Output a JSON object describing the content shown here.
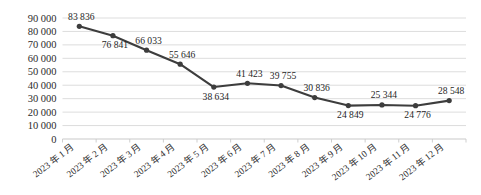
{
  "chart_data": {
    "type": "line",
    "title": "",
    "subtitle": "",
    "xlabel": "",
    "ylabel": "",
    "categories": [
      "2023 年 1 月",
      "2023 年 2 月",
      "2023 年 3 月",
      "2023 年 4 月",
      "2023 年 5 月",
      "2023 年 6 月",
      "2023 年 7 月",
      "2023 年 8 月",
      "2023 年 9 月",
      "2023 年 10 月",
      "2023 年 11 月",
      "2023 年 12 月"
    ],
    "values": [
      83836,
      76841,
      66033,
      55646,
      38634,
      41423,
      39755,
      30836,
      24849,
      25344,
      24776,
      28548
    ],
    "point_labels": [
      "83 836",
      "76 841",
      "66 033",
      "55 646",
      "38 634",
      "41 423",
      "39 755",
      "30 836",
      "24 849",
      "25 344",
      "24 776",
      "28 548"
    ],
    "label_positions": [
      "above",
      "below",
      "above",
      "above",
      "below",
      "above",
      "above",
      "above",
      "below",
      "above",
      "below",
      "above"
    ],
    "ylim": [
      0,
      90000
    ],
    "ytick_values": [
      0,
      10000,
      20000,
      30000,
      40000,
      50000,
      60000,
      70000,
      80000,
      90000
    ],
    "ytick_labels": [
      "0",
      "10 000",
      "20 000",
      "30 000",
      "40 000",
      "50 000",
      "60 000",
      "70 000",
      "80 000",
      "90 000"
    ],
    "grid": true,
    "grid_axis": "y",
    "legend": false,
    "legend_position": "none",
    "series": [
      {
        "name": "",
        "values": [
          83836,
          76841,
          66033,
          55646,
          38634,
          41423,
          39755,
          30836,
          24849,
          25344,
          24776,
          28548
        ],
        "color": "#3d3d3d",
        "marker": "circle",
        "marker_color": "#3d3d3d"
      }
    ],
    "colors": {
      "line": "#3d3d3d",
      "marker": "#3d3d3d",
      "grid": "#d9d9d9",
      "axis": "#c9c9c9",
      "text": "#1f1f1f",
      "background": "#ffffff"
    },
    "xtick_rotation": -38
  }
}
